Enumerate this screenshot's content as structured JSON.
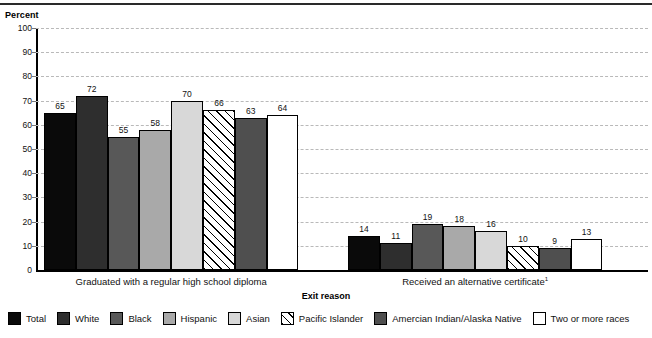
{
  "axis": {
    "y_title": "Percent",
    "x_title": "Exit reason",
    "y_ticks": [
      "100",
      "90",
      "80",
      "70",
      "60",
      "50",
      "40",
      "30",
      "20",
      "10",
      "0"
    ]
  },
  "groups": [
    {
      "label": "Graduated with a regular high school diploma",
      "footnote": ""
    },
    {
      "label": "Received an alternative certificate",
      "footnote": "1"
    }
  ],
  "legend": [
    {
      "label": "Total",
      "swatch": "total-swatch"
    },
    {
      "label": "White",
      "swatch": "white-swatch"
    },
    {
      "label": "Black",
      "swatch": "black-swatch"
    },
    {
      "label": "Hispanic",
      "swatch": "hispanic-swatch"
    },
    {
      "label": "Asian",
      "swatch": "asian-swatch"
    },
    {
      "label": "Pacific Islander",
      "swatch": "pacific-islander-swatch"
    },
    {
      "label": "Amercian Indian/Alaska Native",
      "swatch": "american-indian-swatch"
    },
    {
      "label": "Two or more races",
      "swatch": "two-or-more-races-swatch"
    }
  ],
  "chart_data": {
    "type": "bar",
    "title": "",
    "xlabel": "Exit reason",
    "ylabel": "Percent",
    "ylim": [
      0,
      100
    ],
    "ytick_step": 10,
    "grid": true,
    "legend_position": "bottom",
    "categories": [
      "Graduated with a regular high school diploma",
      "Received an alternative certificate"
    ],
    "series": [
      {
        "name": "Total",
        "values": [
          65,
          14
        ],
        "color": "#0a0a0a",
        "pattern": "solid"
      },
      {
        "name": "White",
        "values": [
          72,
          11
        ],
        "color": "#2e2e2e",
        "pattern": "solid"
      },
      {
        "name": "Black",
        "values": [
          55,
          19
        ],
        "color": "#585858",
        "pattern": "solid"
      },
      {
        "name": "Hispanic",
        "values": [
          58,
          18
        ],
        "color": "#a9a9a9",
        "pattern": "solid"
      },
      {
        "name": "Asian",
        "values": [
          70,
          16
        ],
        "color": "#d8d8d8",
        "pattern": "solid"
      },
      {
        "name": "Pacific Islander",
        "values": [
          66,
          10
        ],
        "color": "#ffffff",
        "pattern": "diagonal-hatch"
      },
      {
        "name": "Amercian Indian/Alaska Native",
        "values": [
          63,
          9
        ],
        "color": "#4f4f4f",
        "pattern": "solid"
      },
      {
        "name": "Two or more races",
        "values": [
          64,
          13
        ],
        "color": "#ffffff",
        "pattern": "solid"
      }
    ]
  }
}
